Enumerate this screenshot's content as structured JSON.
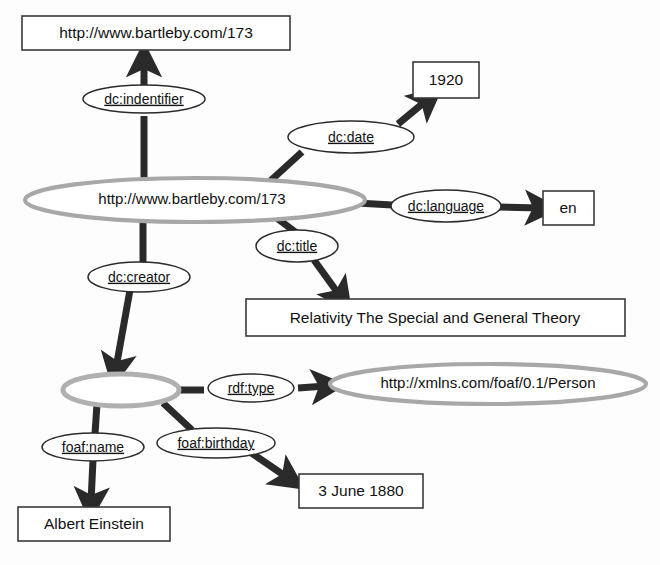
{
  "diagram": {
    "type": "rdf-graph",
    "nodes": {
      "identifier_literal": {
        "label": "http://www.bartleby.com/173",
        "kind": "literal"
      },
      "date_literal": {
        "label": "1920",
        "kind": "literal"
      },
      "subject_resource": {
        "label": "http://www.bartleby.com/173",
        "kind": "resource"
      },
      "language_literal": {
        "label": "en",
        "kind": "literal"
      },
      "title_literal": {
        "label": "Relativity The Special and General Theory",
        "kind": "literal"
      },
      "blank_node": {
        "label": "",
        "kind": "blank"
      },
      "person_class": {
        "label": "http://xmlns.com/foaf/0.1/Person",
        "kind": "resource"
      },
      "birthday_literal": {
        "label": "3 June 1880",
        "kind": "literal"
      },
      "name_literal": {
        "label": "Albert Einstein",
        "kind": "literal"
      }
    },
    "predicates": {
      "identifier": "dc:indentifier",
      "date": "dc:date",
      "language": "dc:language",
      "title": "dc:title",
      "creator": "dc:creator",
      "rdf_type": "rdf:type",
      "foaf_name": "foaf:name",
      "foaf_birthday": "foaf:birthday"
    },
    "colors": {
      "resource_outline": "#a8a8a8",
      "literal_outline": "#3a3a3a",
      "predicate_outline": "#2b2b2b",
      "edge": "#2a2a2a",
      "text": "#111111",
      "background": "#fdfdfd"
    }
  }
}
